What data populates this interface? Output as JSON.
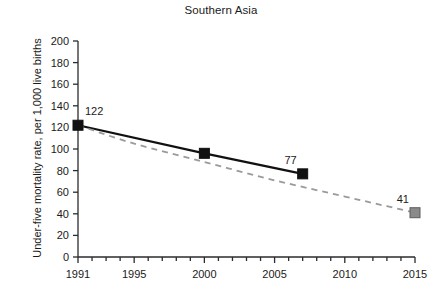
{
  "chart_data": {
    "type": "line",
    "title": "Southern Asia",
    "xlabel": "",
    "ylabel": "Under-five mortality rate, per 1,000 live births",
    "xlim": [
      1991,
      2015
    ],
    "ylim": [
      0,
      200
    ],
    "grid": false,
    "legend": "none",
    "y_ticks": [
      0,
      20,
      40,
      60,
      80,
      100,
      120,
      140,
      160,
      180,
      200
    ],
    "y_tick_labels": [
      "0",
      "20",
      "40",
      "60",
      "80",
      "100",
      "120",
      "140",
      "160",
      "180",
      "200"
    ],
    "x_ticks": [
      1991,
      1992,
      1993,
      1994,
      1995,
      1996,
      1997,
      1998,
      1999,
      2000,
      2001,
      2002,
      2003,
      2004,
      2005,
      2006,
      2007,
      2008,
      2009,
      2010,
      2011,
      2012,
      2013,
      2014,
      2015
    ],
    "x_tick_labels": [
      "1991",
      "1995",
      "2000",
      "2005",
      "2010",
      "2015"
    ],
    "x_labeled_ticks": [
      1991,
      1995,
      2000,
      2005,
      2010,
      2015
    ],
    "series": [
      {
        "name": "observed",
        "style": "solid",
        "color": "#111111",
        "marker": "square",
        "marker_color": "#111111",
        "x": [
          1991,
          2000,
          2007
        ],
        "values": [
          122,
          96,
          77
        ],
        "point_labels": [
          "122",
          "",
          "77"
        ]
      },
      {
        "name": "mdg-target-path",
        "style": "dashed",
        "color": "#9a9a9a",
        "marker": "square",
        "marker_color": "#8a8a8a",
        "x": [
          1991,
          1995,
          2000,
          2005,
          2010,
          2013,
          2015
        ],
        "values": [
          122,
          105,
          88,
          71,
          56,
          47,
          41
        ],
        "point_labels": [
          "",
          "",
          "",
          "",
          "",
          "",
          "41"
        ]
      }
    ],
    "annotations": [
      {
        "text": "122",
        "x": 1991,
        "y": 122,
        "anchor": "above-right"
      },
      {
        "text": "77",
        "x": 2007,
        "y": 77,
        "anchor": "above-left"
      },
      {
        "text": "41",
        "x": 2015,
        "y": 41,
        "anchor": "above-left"
      }
    ]
  }
}
